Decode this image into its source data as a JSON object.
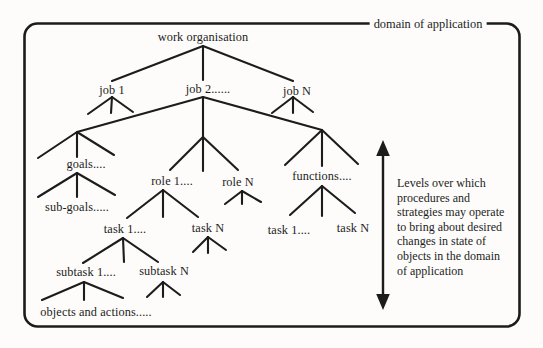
{
  "figure": {
    "border_label": "domain of application",
    "nodes": {
      "work_organisation": "work organisation",
      "job_1": "job 1",
      "job_2": "job 2......",
      "job_n": "job N",
      "goals": "goals....",
      "sub_goals": "sub-goals.....",
      "role_1": "role 1....",
      "role_n": "role N",
      "functions": "functions....",
      "task_1_roles": "task 1....",
      "task_n_roles": "task N",
      "task_1_functions": "task 1....",
      "task_n_functions": "task N",
      "subtask_1": "subtask 1....",
      "subtask_n": "subtask N",
      "objects_and_actions": "objects and actions....."
    },
    "structure": {
      "work_organisation": {
        "job_1": {},
        "job_2": {
          "goals": {
            "sub_goals": {}
          },
          "roles": {
            "role_1": {
              "task_1_roles": {
                "subtask_1": {
                  "objects_and_actions": {}
                },
                "subtask_n": {}
              },
              "task_n_roles": {}
            },
            "role_n": {}
          },
          "functions": {
            "task_1_functions": {},
            "task_n_functions": {}
          }
        },
        "job_n": {}
      }
    },
    "side_note": {
      "lines": [
        "Levels over which",
        "procedures and",
        "strategies may operate",
        "to bring about desired",
        "changes in state of",
        "objects in the domain",
        "of application"
      ]
    },
    "colors": {
      "ink": "#1c1c1c",
      "paper": "#fdfcfa"
    }
  }
}
